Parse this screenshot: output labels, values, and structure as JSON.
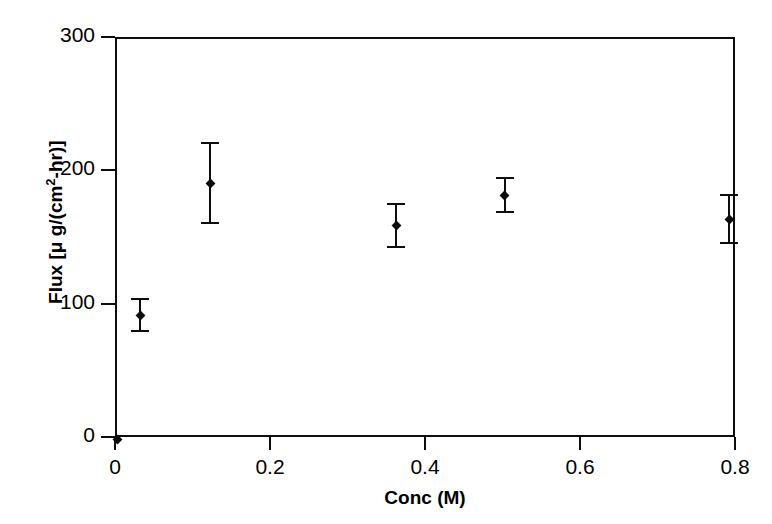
{
  "chart_data": {
    "type": "scatter",
    "title": "",
    "xlabel": "Conc (M)",
    "ylabel": "Flux [μ g/(cm2-hr)]",
    "ylabel_parts": {
      "prefix": "Flux [",
      "mu": "μ",
      "mid": " g/(cm",
      "sup": "2",
      "suffix": "-hr)]"
    },
    "xlim": [
      0,
      0.8
    ],
    "ylim": [
      0,
      300
    ],
    "xticks": [
      "0",
      "0.2",
      "0.4",
      "0.6",
      "0.8"
    ],
    "xtick_values": [
      0,
      0.2,
      0.4,
      0.6,
      0.8
    ],
    "yticks": [
      "0",
      "100",
      "200",
      "300"
    ],
    "ytick_values": [
      0,
      100,
      200,
      300
    ],
    "grid": false,
    "legend": "none",
    "marker_color": "#0d0d0d",
    "axis_color": "#0d0d0d",
    "background_color": "#ffffff",
    "x": [
      0,
      0.03,
      0.12,
      0.36,
      0.5,
      0.79
    ],
    "y": [
      0,
      93,
      192,
      160,
      183,
      165
    ],
    "yerr": [
      0,
      12,
      30,
      16,
      13,
      18
    ],
    "points": [
      {
        "label": "origin-point",
        "x": 0,
        "y": 0,
        "yerr": 0,
        "ylow": 0,
        "yhigh": 0
      },
      {
        "label": "point-1",
        "x": 0.03,
        "y": 93,
        "yerr": 12,
        "ylow": 81,
        "yhigh": 105
      },
      {
        "label": "point-2",
        "x": 0.12,
        "y": 192,
        "yerr": 30,
        "ylow": 162,
        "yhigh": 222
      },
      {
        "label": "point-3",
        "x": 0.36,
        "y": 160,
        "yerr": 16,
        "ylow": 144,
        "yhigh": 176
      },
      {
        "label": "point-4",
        "x": 0.5,
        "y": 183,
        "yerr": 13,
        "ylow": 170,
        "yhigh": 196
      },
      {
        "label": "point-5",
        "x": 0.79,
        "y": 165,
        "yerr": 18,
        "ylow": 147,
        "yhigh": 183
      }
    ]
  }
}
